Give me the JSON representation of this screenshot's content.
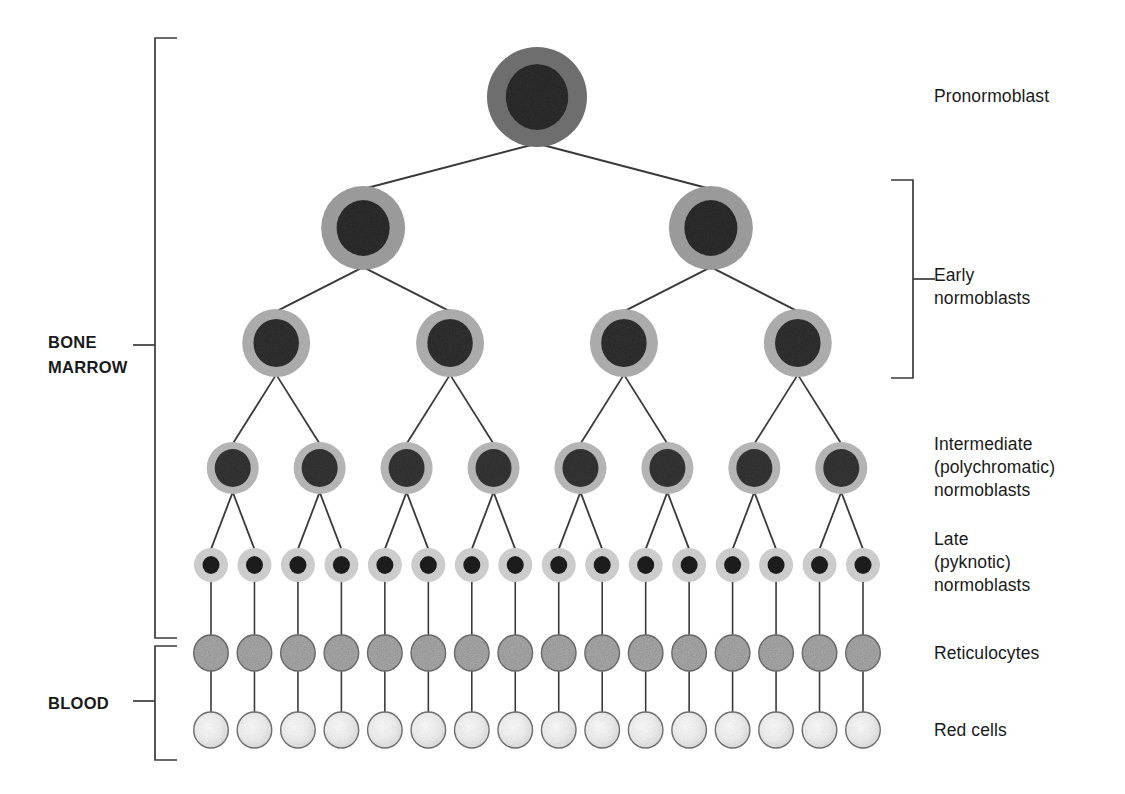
{
  "diagram": {
    "left_labels": [
      {
        "id": "bone-marrow",
        "text": "BONE\nMARROW"
      },
      {
        "id": "blood",
        "text": "BLOOD"
      }
    ],
    "right_labels": [
      {
        "id": "pronormoblast",
        "text": "Pronormoblast"
      },
      {
        "id": "early-normoblasts",
        "text": "Early\nnormoblasts"
      },
      {
        "id": "intermediate-normoblasts",
        "text": "Intermediate\n(polychromatic)\nnormoblasts"
      },
      {
        "id": "late-normoblasts",
        "text": "Late\n(pyknotic)\nnormoblasts"
      },
      {
        "id": "reticulocytes",
        "text": "Reticulocytes"
      },
      {
        "id": "red-cells",
        "text": "Red cells"
      }
    ],
    "rows": [
      {
        "id": "row-pronormoblast",
        "stage": "Pronormoblast",
        "count": 1,
        "cell_radius": 50,
        "nucleus_radius": 33,
        "cytoplasm_color": "#6e6e6e",
        "nucleus_color": "#2b2b2b"
      },
      {
        "id": "row-early",
        "stage": "Early normoblasts",
        "count": 2,
        "cell_radius": 42,
        "nucleus_radius": 28,
        "cytoplasm_color": "#9a9a9a",
        "nucleus_color": "#2b2b2b"
      },
      {
        "id": "row-early-2",
        "stage": "Early normoblasts",
        "count": 4,
        "cell_radius": 34,
        "nucleus_radius": 24,
        "cytoplasm_color": "#ababab",
        "nucleus_color": "#2f2f2f"
      },
      {
        "id": "row-intermediate",
        "stage": "Intermediate normoblasts",
        "count": 8,
        "cell_radius": 26,
        "nucleus_radius": 19,
        "cytoplasm_color": "#b4b4b4",
        "nucleus_color": "#333333"
      },
      {
        "id": "row-late",
        "stage": "Late normoblasts",
        "count": 16,
        "cell_radius": 17,
        "nucleus_radius": 9,
        "cytoplasm_color": "#cccccc",
        "nucleus_color": "#1c1c1c"
      },
      {
        "id": "row-reticulocytes",
        "stage": "Reticulocytes",
        "count": 16,
        "cell_radius": 18,
        "nucleus_radius": 0,
        "cytoplasm_color": "#a9a9a9",
        "nucleus_color": ""
      },
      {
        "id": "row-red-cells",
        "stage": "Red cells",
        "count": 16,
        "cell_radius": 18,
        "nucleus_radius": 0,
        "cytoplasm_color": "#ededed",
        "nucleus_color": ""
      }
    ],
    "colors": {
      "line": "#3a3a3a",
      "bracket": "#3a3a3a",
      "text": "#1a1a1a",
      "background": "#ffffff"
    }
  }
}
